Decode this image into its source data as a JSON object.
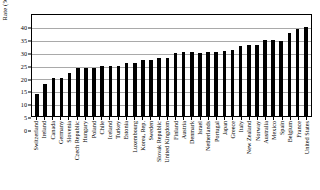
{
  "chart_data": {
    "type": "bar",
    "title": "",
    "xlabel": "",
    "ylabel": "Rate (%)",
    "ylim": [
      0,
      40
    ],
    "ytick_step": 5,
    "yticks": [
      "0",
      "5",
      "10",
      "15",
      "20",
      "25",
      "30",
      "35",
      "40"
    ],
    "grid": "horizontal",
    "legend": "none",
    "bar_color": "#000000",
    "background_color": "#ffffff",
    "gridline_color": "#a9a9a9",
    "categories": [
      "Switzerland",
      "Ireland",
      "Canada",
      "Germany",
      "Slovenia",
      "Czech Republic",
      "Hungary",
      "Poland",
      "Chile",
      "Iceland",
      "Turkey",
      "Estonia",
      "Luxembourg",
      "Korea, Rep.",
      "Sweden",
      "Slovak Republic",
      "United Kingdom",
      "Finland",
      "Austria",
      "Denmark",
      "Israel",
      "Netherlands",
      "Portugal",
      "Japan",
      "Greece",
      "Italy",
      "New Zealand",
      "Norway",
      "Australia",
      "Mexico",
      "Spain",
      "Belgium",
      "France",
      "United States"
    ],
    "values": [
      8.4,
      12.3,
      14.9,
      14.9,
      16.8,
      18.7,
      18.6,
      18.7,
      19.6,
      19.6,
      19.6,
      20.6,
      20.5,
      21.7,
      21.6,
      22.4,
      22.5,
      24.3,
      24.7,
      24.7,
      24.6,
      24.7,
      24.7,
      25.1,
      25.6,
      27.0,
      27.5,
      27.5,
      29.6,
      29.4,
      29.3,
      32.4,
      33.8,
      34.6
    ]
  }
}
